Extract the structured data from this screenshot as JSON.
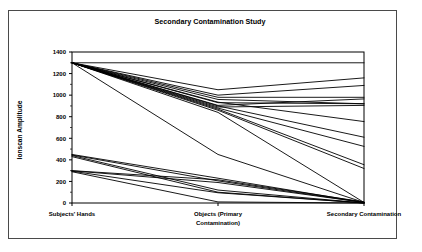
{
  "chart_data": {
    "type": "line",
    "title": "Secondary Contamination Study",
    "xlabel": "",
    "ylabel": "Ionscan Amplitude",
    "categories": [
      "Subjects' Hands",
      "Objects (Primary Contamination)",
      "Secondary Contamination"
    ],
    "category_lines": [
      [
        "Subjects' Hands"
      ],
      [
        "Objects  (Primary",
        "Contamination)"
      ],
      [
        "Secondary Contamination"
      ]
    ],
    "ylim": [
      0,
      1400
    ],
    "yticks": [
      0,
      200,
      400,
      600,
      800,
      1000,
      1200,
      1400
    ],
    "ytick_labels": [
      "0",
      "200",
      "400",
      "600",
      "800",
      "1000",
      "1200",
      "1400"
    ],
    "grid": false,
    "legend": "none",
    "line_color": "#000000",
    "series": [
      {
        "name": "S1",
        "values": [
          1300,
          1300,
          1300
        ]
      },
      {
        "name": "S2",
        "values": [
          1300,
          1050,
          1160
        ]
      },
      {
        "name": "S3",
        "values": [
          1300,
          1000,
          1090
        ]
      },
      {
        "name": "S4",
        "values": [
          1300,
          980,
          980
        ]
      },
      {
        "name": "S5",
        "values": [
          1300,
          960,
          920
        ]
      },
      {
        "name": "S6",
        "values": [
          1300,
          930,
          920
        ]
      },
      {
        "name": "S7",
        "values": [
          1300,
          905,
          965
        ]
      },
      {
        "name": "S8",
        "values": [
          1300,
          890,
          905
        ]
      },
      {
        "name": "S9",
        "values": [
          1300,
          935,
          755
        ]
      },
      {
        "name": "S10",
        "values": [
          1300,
          900,
          610
        ]
      },
      {
        "name": "S11",
        "values": [
          1300,
          880,
          525
        ]
      },
      {
        "name": "S12",
        "values": [
          1300,
          870,
          355
        ]
      },
      {
        "name": "S13",
        "values": [
          1300,
          860,
          320
        ]
      },
      {
        "name": "S14",
        "values": [
          1300,
          840,
          5
        ]
      },
      {
        "name": "S15",
        "values": [
          1300,
          450,
          5
        ]
      },
      {
        "name": "S16",
        "values": [
          450,
          230,
          5
        ]
      },
      {
        "name": "S17",
        "values": [
          445,
          205,
          5
        ]
      },
      {
        "name": "S18",
        "values": [
          440,
          120,
          0
        ]
      },
      {
        "name": "S19",
        "values": [
          430,
          100,
          0
        ]
      },
      {
        "name": "S20",
        "values": [
          300,
          215,
          10
        ]
      },
      {
        "name": "S21",
        "values": [
          298,
          190,
          5
        ]
      },
      {
        "name": "S22",
        "values": [
          295,
          95,
          0
        ]
      },
      {
        "name": "S23",
        "values": [
          290,
          10,
          0
        ]
      }
    ]
  }
}
